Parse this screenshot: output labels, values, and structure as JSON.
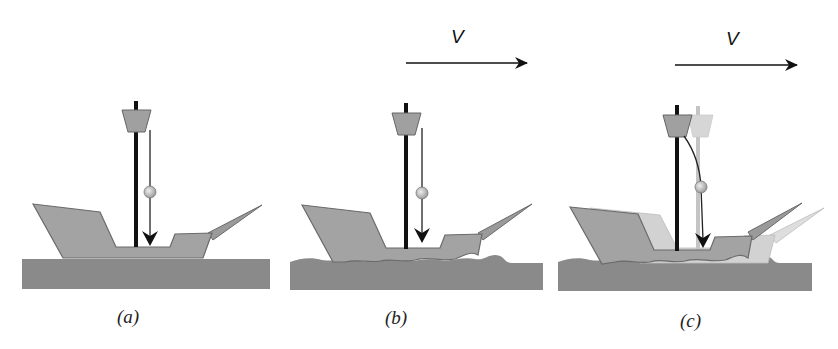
{
  "figure": {
    "panels": [
      {
        "id": "a",
        "label": "(a)",
        "label_pos": [
          112,
          306
        ],
        "velocity": null,
        "ground": "flat",
        "ghost": false,
        "offset": 0
      },
      {
        "id": "b",
        "label": "(b)",
        "label_pos": [
          383,
          306
        ],
        "velocity": {
          "symbol": "V",
          "label_pos": [
            455,
            22
          ],
          "arrow": [
            405,
            63,
            527,
            63
          ]
        },
        "ground": "wavy",
        "ghost": false,
        "offset": 270
      },
      {
        "id": "c",
        "label": "(c)",
        "label_pos": [
          679,
          310
        ],
        "velocity": {
          "symbol": "V",
          "label_pos": [
            728,
            26
          ],
          "arrow": [
            675,
            63,
            797,
            63
          ]
        },
        "ground": "wavy",
        "ghost": true,
        "offset": 540
      }
    ],
    "colors": {
      "ground": "#8a8a8a",
      "hull": "#a3a3a3",
      "hull_outline": "#6a6a6a",
      "ghost_hull": "#cfcfcf",
      "mast": "#111111",
      "ghost_mast": "#c4c4c4",
      "ball": "#c9c9c9",
      "arrow": "#111111"
    }
  }
}
